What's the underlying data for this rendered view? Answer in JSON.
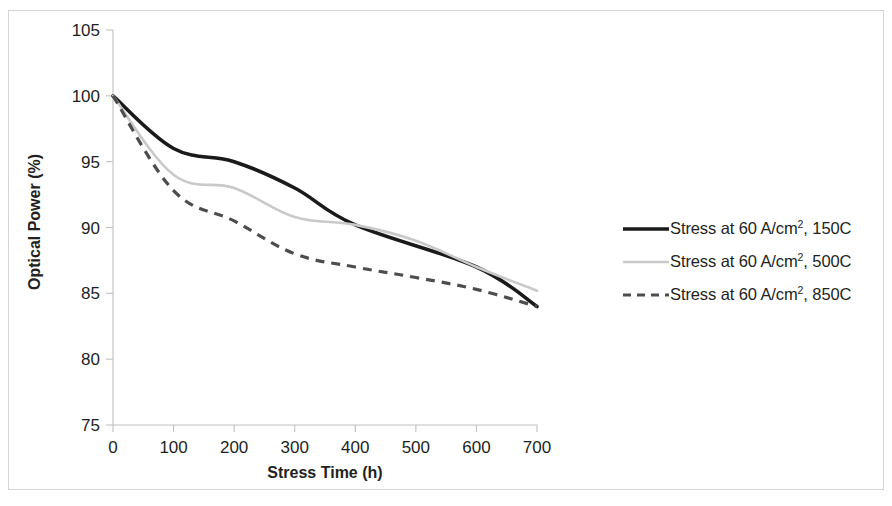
{
  "chart_data": {
    "type": "line",
    "title": "",
    "xlabel": "Stress Time (h)",
    "ylabel": "Optical Power (%)",
    "xlim": [
      0,
      700
    ],
    "ylim": [
      75,
      105
    ],
    "xticks": [
      0,
      100,
      200,
      300,
      400,
      500,
      600,
      700
    ],
    "yticks": [
      75,
      80,
      85,
      90,
      95,
      100,
      105
    ],
    "xtick_labels": [
      "0",
      "100",
      "200",
      "300",
      "400",
      "500",
      "600",
      "700"
    ],
    "ytick_labels": [
      "75",
      "80",
      "85",
      "90",
      "95",
      "100",
      "105"
    ],
    "grid": false,
    "legend_position": "right",
    "series": [
      {
        "name": "Stress at 60 A/cm2, 150C",
        "label_prefix": "Stress at 60 A/cm",
        "label_sup": "2",
        "label_suffix": ", 150C",
        "style": "solid",
        "color": "#1a1a1a",
        "x": [
          0,
          100,
          200,
          300,
          400,
          600,
          700
        ],
        "values": [
          100,
          96,
          95,
          93,
          90.2,
          87,
          84
        ]
      },
      {
        "name": "Stress at 60 A/cm2, 500C",
        "label_prefix": "Stress at 60 A/cm",
        "label_sup": "2",
        "label_suffix": ", 500C",
        "style": "solid-thin",
        "color": "#c9c9c9",
        "x": [
          0,
          100,
          200,
          300,
          400,
          500,
          600,
          700
        ],
        "values": [
          100,
          94,
          93,
          90.8,
          90.2,
          89,
          87,
          85.2
        ]
      },
      {
        "name": "Stress at 60 A/cm2, 850C",
        "label_prefix": "Stress at 60 A/cm",
        "label_sup": "2",
        "label_suffix": ", 850C",
        "style": "dashed",
        "color": "#4d4d4d",
        "x": [
          0,
          100,
          200,
          300,
          400,
          500,
          600,
          700
        ],
        "values": [
          100,
          92.8,
          90.5,
          88,
          87,
          86.2,
          85.3,
          84
        ]
      }
    ]
  },
  "axes": {
    "y_title": "Optical Power (%)",
    "x_title": "Stress Time (h)",
    "y_labels": [
      "105",
      "100",
      "95",
      "90",
      "85",
      "80",
      "75"
    ],
    "x_labels": [
      "0",
      "100",
      "200",
      "300",
      "400",
      "500",
      "600",
      "700"
    ]
  },
  "legend": {
    "items": [
      {
        "prefix": "Stress at 60 A/cm",
        "sup": "2",
        "suffix": ", 150C",
        "style": "solid"
      },
      {
        "prefix": "Stress at 60 A/cm",
        "sup": "2",
        "suffix": ", 500C",
        "style": "solid-thin"
      },
      {
        "prefix": "Stress at 60 A/cm",
        "sup": "2",
        "suffix": ", 850C",
        "style": "dashed"
      }
    ]
  },
  "colors": {
    "series_150c": "#1a1a1a",
    "series_500c": "#c9c9c9",
    "series_850c": "#4d4d4d",
    "axis": "#bfbfbf",
    "frame": "#d4d4d4",
    "text": "#231f20"
  }
}
